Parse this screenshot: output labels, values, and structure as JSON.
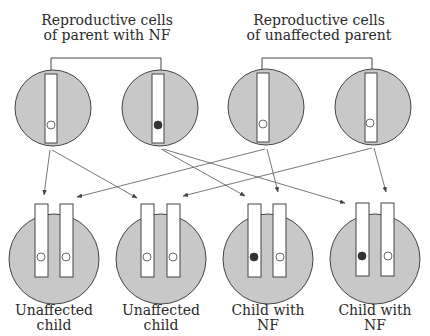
{
  "parents": [
    {
      "label_line1": "Reproductive cells",
      "label_line2": "of parent with NF",
      "cells": [
        {
          "allele": "normal"
        },
        {
          "allele": "NF"
        }
      ]
    },
    {
      "label_line1": "Reproductive cells",
      "label_line2": "of unaffected parent",
      "cells": [
        {
          "allele": "normal"
        },
        {
          "allele": "normal"
        }
      ]
    }
  ],
  "children": [
    {
      "label_line1": "Unaffected",
      "label_line2": "child",
      "alleles": [
        "normal",
        "normal"
      ]
    },
    {
      "label_line1": "Unaffected",
      "label_line2": "child",
      "alleles": [
        "normal",
        "normal"
      ]
    },
    {
      "label_line1": "Child with",
      "label_line2": "NF",
      "alleles": [
        "NF",
        "normal"
      ]
    },
    {
      "label_line1": "Child with",
      "label_line2": "NF",
      "alleles": [
        "NF",
        "normal"
      ]
    }
  ],
  "colors": {
    "cell_fill": "#c8c8c8",
    "outline": "#444444",
    "nf_allele": "#333333",
    "normal_allele": "#ffffff"
  }
}
